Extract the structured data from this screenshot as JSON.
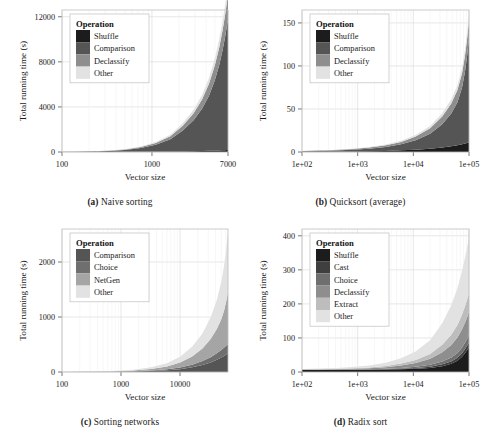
{
  "figure": {
    "axis_labels": {
      "x": "Vector size",
      "y": "Total running time (s)"
    },
    "legend_title": "Operation",
    "palette": {
      "shuffle": "#1c1c1c",
      "cast": "#3f3f3f",
      "comparison": "#555555",
      "choice": "#6f6f6f",
      "declassify": "#8e8e8e",
      "netgen": "#a5a5a5",
      "extract": "#bdbdbd",
      "other": "#e2e2e2",
      "grid": "#dcdcdc",
      "border": "#bfbfbf",
      "text": "#1a1a1a",
      "background": "#ffffff"
    }
  },
  "panels": [
    {
      "id": "a",
      "caption_tag": "(a)",
      "caption_text": "Naive sorting"
    },
    {
      "id": "b",
      "caption_tag": "(b)",
      "caption_text": "Quicksort (average)"
    },
    {
      "id": "c",
      "caption_tag": "(c)",
      "caption_text": "Sorting networks"
    },
    {
      "id": "d",
      "caption_tag": "(d)",
      "caption_text": "Radix sort"
    }
  ],
  "chart_data": [
    {
      "panel": "a",
      "type": "area",
      "title": "Naive sorting",
      "xlabel": "Vector size",
      "ylabel": "Total running time (s)",
      "xscale": "log",
      "xlim": [
        100,
        7000
      ],
      "ylim": [
        0,
        12600
      ],
      "xticks": [
        100,
        1000,
        7000
      ],
      "xticklabels": [
        "100",
        "1000",
        "7000"
      ],
      "yticks": [
        0,
        4000,
        8000,
        12000
      ],
      "yticklabels": [
        "0",
        "4000",
        "8000",
        "12000"
      ],
      "grid": true,
      "legend": {
        "title": "Operation",
        "position": "top-left",
        "entries": [
          "Shuffle",
          "Comparison",
          "Declassify",
          "Other"
        ]
      },
      "x": [
        100,
        150,
        220,
        330,
        500,
        750,
        1100,
        1600,
        2200,
        2900,
        3600,
        4300,
        5000,
        5600,
        6100,
        6500,
        6800,
        7000
      ],
      "series": [
        {
          "name": "Shuffle",
          "values": [
            2,
            3,
            5,
            8,
            12,
            18,
            26,
            38,
            52,
            68,
            84,
            100,
            118,
            134,
            148,
            160,
            170,
            176
          ]
        },
        {
          "name": "Comparison",
          "values": [
            8,
            18,
            40,
            85,
            170,
            330,
            620,
            1100,
            1850,
            2750,
            3750,
            4900,
            6250,
            7600,
            8900,
            10050,
            11000,
            11560
          ]
        },
        {
          "name": "Declassify",
          "values": [
            3,
            6,
            12,
            24,
            46,
            86,
            155,
            265,
            430,
            620,
            830,
            1060,
            1320,
            1560,
            1770,
            1950,
            2080,
            2150
          ]
        },
        {
          "name": "Other",
          "values": [
            2,
            4,
            7,
            13,
            24,
            44,
            78,
            132,
            210,
            300,
            400,
            505,
            620,
            725,
            815,
            890,
            945,
            975
          ]
        }
      ],
      "stacked_total_at_max": 12600
    },
    {
      "panel": "b",
      "type": "area",
      "title": "Quicksort (average)",
      "xlabel": "Vector size",
      "ylabel": "Total running time (s)",
      "xscale": "log",
      "xlim": [
        100,
        100000
      ],
      "ylim": [
        0,
        165
      ],
      "xticks": [
        100,
        1000,
        10000,
        100000
      ],
      "xticklabels": [
        "1e+02",
        "1e+03",
        "1e+04",
        "1e+05"
      ],
      "yticks": [
        0,
        50,
        100,
        150
      ],
      "yticklabels": [
        "0",
        "50",
        "100",
        "150"
      ],
      "grid": true,
      "legend": {
        "title": "Operation",
        "position": "top-left",
        "entries": [
          "Shuffle",
          "Comparison",
          "Declassify",
          "Other"
        ]
      },
      "x": [
        100,
        200,
        400,
        800,
        1600,
        3200,
        6000,
        11000,
        20000,
        33000,
        48000,
        62000,
        75000,
        85000,
        92000,
        97000,
        100000
      ],
      "series": [
        {
          "name": "Shuffle",
          "values": [
            0.2,
            0.3,
            0.4,
            0.6,
            0.9,
            1.3,
            1.9,
            2.7,
            3.8,
            5.2,
            6.6,
            7.8,
            9.0,
            9.9,
            10.5,
            11.0,
            11.3
          ]
        },
        {
          "name": "Comparison",
          "values": [
            0.6,
            0.9,
            1.3,
            2.0,
            3.0,
            4.6,
            7.0,
            11.0,
            17.5,
            27.0,
            38.0,
            50.0,
            66.0,
            84.0,
            100.0,
            113.0,
            120.0
          ]
        },
        {
          "name": "Declassify",
          "values": [
            0.3,
            0.4,
            0.6,
            0.9,
            1.3,
            1.9,
            2.8,
            4.2,
            6.2,
            9.0,
            11.8,
            14.2,
            16.6,
            18.4,
            19.6,
            20.4,
            20.9
          ]
        },
        {
          "name": "Other",
          "values": [
            0.1,
            0.2,
            0.3,
            0.4,
            0.6,
            0.9,
            1.3,
            1.9,
            2.7,
            3.8,
            4.8,
            5.6,
            6.4,
            7.0,
            7.4,
            7.7,
            7.9
          ]
        }
      ],
      "stacked_total_at_max": 160
    },
    {
      "panel": "c",
      "type": "area",
      "title": "Sorting networks",
      "xlabel": "Vector size",
      "ylabel": "Total running time (s)",
      "xscale": "log",
      "xlim": [
        100,
        65000
      ],
      "ylim": [
        0,
        2600
      ],
      "xticks": [
        100,
        1000,
        10000
      ],
      "xticklabels": [
        "100",
        "1000",
        "10000"
      ],
      "yticks": [
        0,
        1000,
        2000
      ],
      "yticklabels": [
        "0",
        "1000",
        "2000"
      ],
      "grid": true,
      "legend": {
        "title": "Operation",
        "position": "top-left",
        "entries": [
          "Comparison",
          "Choice",
          "NetGen",
          "Other"
        ]
      },
      "x": [
        100,
        200,
        400,
        800,
        1600,
        3200,
        6000,
        10000,
        16000,
        24000,
        33000,
        42000,
        50000,
        56000,
        60000,
        63000,
        65000
      ],
      "series": [
        {
          "name": "Comparison",
          "values": [
            0.5,
            1.0,
            2.0,
            4.0,
            8,
            16,
            30,
            52,
            85,
            128,
            175,
            222,
            262,
            292,
            312,
            326,
            334
          ]
        },
        {
          "name": "Choice",
          "values": [
            0.3,
            0.6,
            1.2,
            2.4,
            5,
            10,
            18,
            30,
            48,
            70,
            94,
            118,
            138,
            153,
            163,
            170,
            174
          ]
        },
        {
          "name": "NetGen",
          "values": [
            0.8,
            1.6,
            3.2,
            7,
            14,
            28,
            52,
            90,
            150,
            230,
            330,
            440,
            560,
            680,
            790,
            880,
            940
          ]
        },
        {
          "name": "Other",
          "values": [
            0.9,
            1.8,
            3.6,
            8,
            16,
            32,
            60,
            105,
            175,
            270,
            395,
            530,
            680,
            820,
            940,
            1030,
            1090
          ]
        }
      ],
      "stacked_total_at_max": 2540
    },
    {
      "panel": "d",
      "type": "area",
      "title": "Radix sort",
      "xlabel": "Vector size",
      "ylabel": "Total running time (s)",
      "xscale": "log",
      "xlim": [
        100,
        100000
      ],
      "ylim": [
        0,
        420
      ],
      "xticks": [
        100,
        1000,
        10000,
        100000
      ],
      "xticklabels": [
        "1e+02",
        "1e+03",
        "1e+04",
        "1e+05"
      ],
      "yticks": [
        0,
        100,
        200,
        300,
        400
      ],
      "yticklabels": [
        "0",
        "100",
        "200",
        "300",
        "400"
      ],
      "grid": true,
      "legend": {
        "title": "Operation",
        "position": "top-left",
        "entries": [
          "Shuffle",
          "Cast",
          "Choice",
          "Declassify",
          "Extract",
          "Other"
        ]
      },
      "x": [
        100,
        200,
        400,
        800,
        1600,
        3200,
        6000,
        11000,
        20000,
        33000,
        48000,
        62000,
        75000,
        85000,
        92000,
        97000,
        100000
      ],
      "series": [
        {
          "name": "Shuffle",
          "values": [
            6,
            6,
            6,
            6.2,
            6.5,
            7,
            8,
            9.5,
            12,
            17,
            24,
            33,
            45,
            56,
            64,
            70,
            74
          ]
        },
        {
          "name": "Cast",
          "values": [
            0.4,
            0.4,
            0.5,
            0.6,
            0.8,
            1.1,
            1.6,
            2.4,
            3.6,
            5.4,
            7.2,
            8.8,
            10.4,
            11.6,
            12.4,
            13.0,
            13.3
          ]
        },
        {
          "name": "Choice",
          "values": [
            0.3,
            0.4,
            0.5,
            0.7,
            1.0,
            1.5,
            2.3,
            3.6,
            5.6,
            8.6,
            11.6,
            14.2,
            16.8,
            18.8,
            20.0,
            21.0,
            21.5
          ]
        },
        {
          "name": "Declassify",
          "values": [
            0.6,
            0.8,
            1.2,
            1.8,
            2.8,
            4.4,
            7.0,
            11.0,
            17.5,
            27.0,
            36.5,
            45.0,
            53.0,
            59.0,
            63.0,
            66.0,
            67.5
          ]
        },
        {
          "name": "Extract",
          "values": [
            0.5,
            0.7,
            1.0,
            1.5,
            2.3,
            3.6,
            5.7,
            9.0,
            14.2,
            22.0,
            30.0,
            37.0,
            43.5,
            48.5,
            52.0,
            54.0,
            55.5
          ]
        },
        {
          "name": "Other",
          "values": [
            1.2,
            1.7,
            2.5,
            3.8,
            6.0,
            9.6,
            15.5,
            25.0,
            40.0,
            63.0,
            87.0,
            108.0,
            128.0,
            143.0,
            153.0,
            160.0,
            164.0
          ]
        }
      ],
      "stacked_total_at_max": 396
    }
  ]
}
